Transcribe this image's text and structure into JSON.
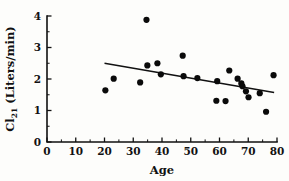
{
  "figure": {
    "title": "",
    "background_color": "#fdfdfb",
    "ink_color": "#111111"
  },
  "axes": {
    "x_title": "Age",
    "y_title_main": "Cl",
    "y_title_sub": "21",
    "y_title_unit": " (Liters/min)",
    "y_title_full": "Cl21 (Liters/min)",
    "x_tick_labels": [
      "0",
      "10",
      "20",
      "30",
      "40",
      "50",
      "60",
      "70",
      "80"
    ],
    "y_tick_labels": [
      "0",
      "1",
      "2",
      "3",
      "4"
    ]
  },
  "chart_data": {
    "type": "scatter",
    "title": "",
    "xlabel": "Age",
    "ylabel": "Cl21 (Liters/min)",
    "xlim": [
      0,
      80
    ],
    "ylim": [
      0,
      4
    ],
    "xticks": [
      0,
      10,
      20,
      30,
      40,
      50,
      60,
      70,
      80
    ],
    "yticks": [
      0,
      1,
      2,
      3,
      4
    ],
    "x_minor_ticks": [
      5,
      15,
      25,
      35,
      45,
      55,
      65,
      75
    ],
    "y_minor_ticks": [
      0.5,
      1.5,
      2.5,
      3.5
    ],
    "grid": false,
    "legend": null,
    "marker": "filled-circle",
    "marker_color": "#0a0a0a",
    "marker_size_px": 3.1,
    "points": [
      {
        "x": 20.3,
        "y": 1.64
      },
      {
        "x": 23.2,
        "y": 2.01
      },
      {
        "x": 32.4,
        "y": 1.89
      },
      {
        "x": 34.6,
        "y": 3.88
      },
      {
        "x": 34.9,
        "y": 2.43
      },
      {
        "x": 38.4,
        "y": 2.5
      },
      {
        "x": 39.6,
        "y": 2.15
      },
      {
        "x": 47.2,
        "y": 2.74
      },
      {
        "x": 47.5,
        "y": 2.09
      },
      {
        "x": 52.3,
        "y": 2.03
      },
      {
        "x": 58.9,
        "y": 1.31
      },
      {
        "x": 59.2,
        "y": 1.93
      },
      {
        "x": 62.1,
        "y": 1.3
      },
      {
        "x": 63.4,
        "y": 2.27
      },
      {
        "x": 66.3,
        "y": 2.01
      },
      {
        "x": 67.6,
        "y": 1.86
      },
      {
        "x": 68.0,
        "y": 1.77
      },
      {
        "x": 69.2,
        "y": 1.61
      },
      {
        "x": 70.1,
        "y": 1.42
      },
      {
        "x": 74.0,
        "y": 1.55
      },
      {
        "x": 76.2,
        "y": 0.96
      },
      {
        "x": 78.8,
        "y": 2.12
      }
    ],
    "fit_line": {
      "type": "linear-regression",
      "x_start": 20.0,
      "y_start": 2.5,
      "x_end": 79.0,
      "y_end": 1.57,
      "slope": -0.01576,
      "intercept": 2.8153
    }
  }
}
